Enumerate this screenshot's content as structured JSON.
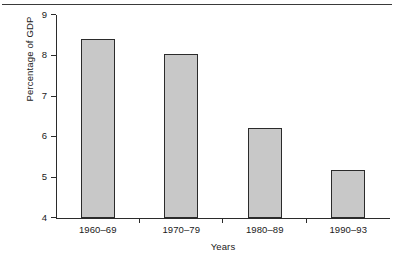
{
  "chart_data": {
    "type": "bar",
    "title": "",
    "xlabel": "Years",
    "ylabel": "Percentage of GDP",
    "categories": [
      "1960–69",
      "1970–79",
      "1980–89",
      "1990–93"
    ],
    "values": [
      8.4,
      8.05,
      6.22,
      5.18
    ],
    "ylim": [
      4,
      9
    ],
    "yticks": [
      "4",
      "5",
      "6",
      "7",
      "8",
      "9"
    ],
    "ytick_values": [
      4,
      5,
      6,
      7,
      8,
      9
    ],
    "grid": false,
    "legend": null,
    "series": [
      {
        "name": "Percentage of GDP",
        "values": [
          8.4,
          8.05,
          6.22,
          5.18
        ]
      }
    ],
    "colors": {
      "bar_fill": "#c8c8c8",
      "bar_stroke": "#2b2b2b",
      "axis": "#2b2b2b",
      "text": "#1a1a1a",
      "rule": "#3a3a3a"
    }
  }
}
